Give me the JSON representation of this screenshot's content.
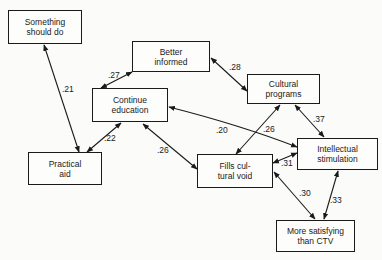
{
  "diagram": {
    "type": "path-diagram",
    "nodes": [
      {
        "id": "something",
        "label": "Something\nshould do",
        "x": 8,
        "y": 10,
        "w": 74,
        "h": 34
      },
      {
        "id": "better",
        "label": "Better\ninformed",
        "x": 132,
        "y": 41,
        "w": 78,
        "h": 31
      },
      {
        "id": "continue",
        "label": "Continue\neducation",
        "x": 92,
        "y": 88,
        "w": 76,
        "h": 34
      },
      {
        "id": "cultural",
        "label": "Cultural\nprograms",
        "x": 247,
        "y": 74,
        "w": 73,
        "h": 30
      },
      {
        "id": "practical",
        "label": "Practical\naid",
        "x": 28,
        "y": 152,
        "w": 74,
        "h": 33
      },
      {
        "id": "fills",
        "label": "Fills cul-\ntural void",
        "x": 197,
        "y": 154,
        "w": 76,
        "h": 34
      },
      {
        "id": "intellectual",
        "label": "Intellectual\nstimulation",
        "x": 297,
        "y": 138,
        "w": 81,
        "h": 32
      },
      {
        "id": "more",
        "label": "More satisfying\nthan CTV",
        "x": 276,
        "y": 220,
        "w": 79,
        "h": 32
      }
    ],
    "edges": [
      {
        "from": "practical",
        "to": "something",
        "coef": ".21",
        "bidirectional": true
      },
      {
        "from": "continue",
        "to": "better",
        "coef": ".27",
        "bidirectional": true
      },
      {
        "from": "better",
        "to": "cultural",
        "coef": ".28",
        "bidirectional": true
      },
      {
        "from": "practical",
        "to": "continue",
        "coef": ".22",
        "bidirectional": true
      },
      {
        "from": "continue",
        "to": "fills",
        "coef": ".26",
        "bidirectional": true
      },
      {
        "from": "intellectual",
        "to": "continue",
        "coef": ".20",
        "bidirectional": true
      },
      {
        "from": "fills",
        "to": "cultural",
        "coef": ".26",
        "bidirectional": true
      },
      {
        "from": "cultural",
        "to": "intellectual",
        "coef": ".37",
        "bidirectional": true
      },
      {
        "from": "fills",
        "to": "intellectual",
        "coef": ".31",
        "bidirectional": true
      },
      {
        "from": "fills",
        "to": "more",
        "coef": ".30",
        "bidirectional": true
      },
      {
        "from": "more",
        "to": "intellectual",
        "coef": ".33",
        "bidirectional": true
      }
    ]
  },
  "labels": {
    "something": "Something\nshould do",
    "better": "Better\ninformed",
    "continue": "Continue\neducation",
    "cultural": "Cultural\nprograms",
    "practical": "Practical\naid",
    "fills": "Fills cul-\ntural void",
    "intellectual": "Intellectual\nstimulation",
    "more": "More satisfying\nthan CTV"
  },
  "coefs": {
    "c21": ".21",
    "c27": ".27",
    "c28": ".28",
    "c22": ".22",
    "c26a": ".26",
    "c20": ".20",
    "c26b": ".26",
    "c37": ".37",
    "c31": ".31",
    "c30": ".30",
    "c33": ".33"
  }
}
